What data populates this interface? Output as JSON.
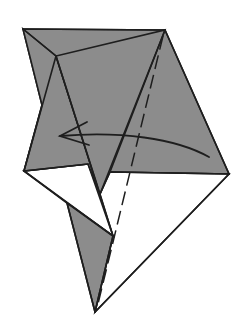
{
  "diagram": {
    "type": "origami-fold-step",
    "colors": {
      "paper_colored_side": "#8c8c8c",
      "paper_white_side": "#ffffff",
      "lines": "#1e1e1e"
    },
    "symbols": [
      {
        "name": "valley-fold-line",
        "style": "dashed"
      },
      {
        "name": "fold-direction-arrow",
        "direction": "right-to-left"
      }
    ]
  }
}
